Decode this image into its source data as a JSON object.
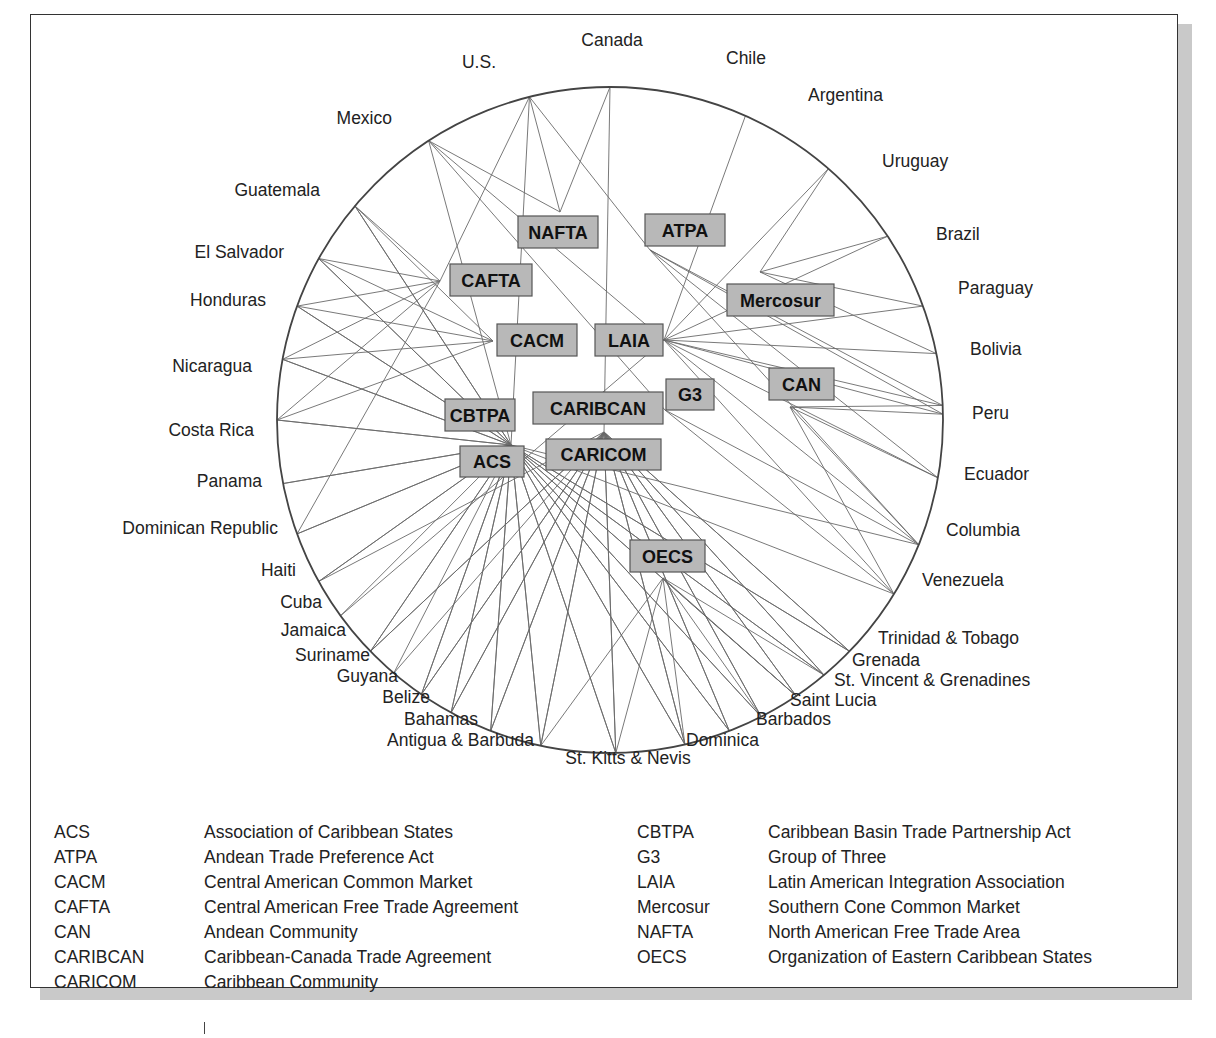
{
  "diagram": {
    "title": "",
    "circle": {
      "cx": 610,
      "cy": 420,
      "r": 333
    },
    "countries": [
      {
        "id": "canada",
        "label": "Canada",
        "angle": -90,
        "lx": 612,
        "ly": 46,
        "anchor": "middle"
      },
      {
        "id": "chile",
        "label": "Chile",
        "angle": -66,
        "lx": 726,
        "ly": 64,
        "anchor": "start"
      },
      {
        "id": "argentina",
        "label": "Argentina",
        "angle": -49,
        "lx": 808,
        "ly": 101,
        "anchor": "start"
      },
      {
        "id": "uruguay",
        "label": "Uruguay",
        "angle": -33.5,
        "lx": 882,
        "ly": 167,
        "anchor": "start"
      },
      {
        "id": "brazil",
        "label": "Brazil",
        "angle": -20,
        "lx": 936,
        "ly": 240,
        "anchor": "start"
      },
      {
        "id": "paraguay",
        "label": "Paraguay",
        "angle": -11.5,
        "lx": 958,
        "ly": 294,
        "anchor": "start"
      },
      {
        "id": "bolivia",
        "label": "Bolivia",
        "angle": -2.5,
        "lx": 970,
        "ly": 355,
        "anchor": "start"
      },
      {
        "id": "peru",
        "label": "Peru",
        "angle": -1,
        "lx": 972,
        "ly": 419,
        "anchor": "start"
      },
      {
        "id": "ecuador",
        "label": "Ecuador",
        "angle": 10,
        "lx": 964,
        "ly": 480,
        "anchor": "start"
      },
      {
        "id": "columbia",
        "label": "Columbia",
        "angle": 22,
        "lx": 946,
        "ly": 536,
        "anchor": "start"
      },
      {
        "id": "venezuela",
        "label": "Venezuela",
        "angle": 31.5,
        "lx": 922,
        "ly": 586,
        "anchor": "start"
      },
      {
        "id": "trinidad",
        "label": "Trinidad & Tobago",
        "angle": 44,
        "lx": 878,
        "ly": 644,
        "anchor": "start"
      },
      {
        "id": "grenada",
        "label": "Grenada",
        "angle": 50,
        "lx": 852,
        "ly": 666,
        "anchor": "start"
      },
      {
        "id": "stvincent",
        "label": "St. Vincent & Grenadines",
        "angle": 56,
        "lx": 834,
        "ly": 686,
        "anchor": "start"
      },
      {
        "id": "saintlucia",
        "label": "Saint Lucia",
        "angle": 63,
        "lx": 790,
        "ly": 706,
        "anchor": "start"
      },
      {
        "id": "barbados",
        "label": "Barbados",
        "angle": 69,
        "lx": 756,
        "ly": 725,
        "anchor": "start"
      },
      {
        "id": "dominica",
        "label": "Dominica",
        "angle": 77,
        "lx": 686,
        "ly": 746,
        "anchor": "start"
      },
      {
        "id": "stkitts",
        "label": "St. Kitts & Nevis",
        "angle": 89,
        "lx": 628,
        "ly": 764,
        "anchor": "middle"
      },
      {
        "id": "antigua",
        "label": "Antigua & Barbuda",
        "angle": 102,
        "lx": 534,
        "ly": 746,
        "anchor": "end"
      },
      {
        "id": "bahamas",
        "label": "Bahamas",
        "angle": 111,
        "lx": 478,
        "ly": 725,
        "anchor": "end"
      },
      {
        "id": "belize",
        "label": "Belize",
        "angle": 118.5,
        "lx": 430,
        "ly": 703,
        "anchor": "end"
      },
      {
        "id": "guyana",
        "label": "Guyana",
        "angle": 124.5,
        "lx": 398,
        "ly": 682,
        "anchor": "end"
      },
      {
        "id": "suriname",
        "label": "Suriname",
        "angle": 130.5,
        "lx": 370,
        "ly": 661,
        "anchor": "end"
      },
      {
        "id": "jamaica",
        "label": "Jamaica",
        "angle": 136,
        "lx": 346,
        "ly": 636,
        "anchor": "end"
      },
      {
        "id": "cuba",
        "label": "Cuba",
        "angle": 144,
        "lx": 322,
        "ly": 608,
        "anchor": "end"
      },
      {
        "id": "haiti",
        "label": "Haiti",
        "angle": 151,
        "lx": 296,
        "ly": 576,
        "anchor": "end"
      },
      {
        "id": "dominican",
        "label": "Dominican Republic",
        "angle": 160,
        "lx": 278,
        "ly": 534,
        "anchor": "end"
      },
      {
        "id": "panama",
        "label": "Panama",
        "angle": 169,
        "lx": 262,
        "ly": 487,
        "anchor": "end"
      },
      {
        "id": "costarica",
        "label": "Costa Rica",
        "angle": 180,
        "lx": 254,
        "ly": 436,
        "anchor": "end"
      },
      {
        "id": "nicaragua",
        "label": "Nicaragua",
        "angle": 190.5,
        "lx": 252,
        "ly": 372,
        "anchor": "end"
      },
      {
        "id": "honduras",
        "label": "Honduras",
        "angle": 200,
        "lx": 266,
        "ly": 306,
        "anchor": "end"
      },
      {
        "id": "elsalvador",
        "label": "El Salvador",
        "angle": 209,
        "lx": 284,
        "ly": 258,
        "anchor": "end"
      },
      {
        "id": "guatemala",
        "label": "Guatemala",
        "angle": 220,
        "lx": 320,
        "ly": 196,
        "anchor": "end"
      },
      {
        "id": "mexico",
        "label": "Mexico",
        "angle": 237,
        "lx": 392,
        "ly": 124,
        "anchor": "end"
      },
      {
        "id": "us",
        "label": "U.S.",
        "angle": 256,
        "lx": 496,
        "ly": 68,
        "anchor": "end"
      }
    ],
    "hubs": [
      {
        "id": "NAFTA",
        "label": "NAFTA",
        "x": 518,
        "y": 216,
        "w": 80,
        "h": 32,
        "px": 560,
        "py": 212
      },
      {
        "id": "ATPA",
        "label": "ATPA",
        "x": 645,
        "y": 214,
        "w": 80,
        "h": 32,
        "px": 650,
        "py": 250
      },
      {
        "id": "CAFTA",
        "label": "CAFTA",
        "x": 450,
        "y": 264,
        "w": 82,
        "h": 32,
        "px": 440,
        "py": 281
      },
      {
        "id": "Mercosur",
        "label": "Mercosur",
        "x": 727,
        "y": 284,
        "w": 107,
        "h": 32,
        "px": 760,
        "py": 272
      },
      {
        "id": "CACM",
        "label": "CACM",
        "x": 497,
        "y": 324,
        "w": 80,
        "h": 32,
        "px": 493,
        "py": 341
      },
      {
        "id": "LAIA",
        "label": "LAIA",
        "x": 595,
        "y": 324,
        "w": 68,
        "h": 32,
        "px": 664,
        "py": 340
      },
      {
        "id": "CAN",
        "label": "CAN",
        "x": 769,
        "y": 368,
        "w": 65,
        "h": 32,
        "px": 790,
        "py": 407
      },
      {
        "id": "G3",
        "label": "G3",
        "x": 666,
        "y": 379,
        "w": 48,
        "h": 31,
        "px": 665,
        "py": 410
      },
      {
        "id": "CARIBCAN",
        "label": "CARIBCAN",
        "x": 533,
        "y": 392,
        "w": 130,
        "h": 32,
        "px": 604,
        "py": 432
      },
      {
        "id": "CBTPA",
        "label": "CBTPA",
        "x": 445,
        "y": 399,
        "w": 70,
        "h": 32,
        "px": 511,
        "py": 445
      },
      {
        "id": "ACS",
        "label": "ACS",
        "x": 460,
        "y": 446,
        "w": 64,
        "h": 31,
        "px": 511,
        "py": 445
      },
      {
        "id": "CARICOM",
        "label": "CARICOM",
        "x": 546,
        "y": 439,
        "w": 115,
        "h": 31,
        "px": 604,
        "py": 432
      },
      {
        "id": "OECS",
        "label": "OECS",
        "x": 630,
        "y": 540,
        "w": 75,
        "h": 32,
        "px": 663,
        "py": 578
      }
    ],
    "memberships": {
      "NAFTA": [
        "us",
        "canada",
        "mexico"
      ],
      "ATPA": [
        "bolivia",
        "columbia",
        "ecuador",
        "peru",
        "us"
      ],
      "CAFTA": [
        "us",
        "guatemala",
        "elsalvador",
        "honduras",
        "nicaragua",
        "costarica",
        "dominican"
      ],
      "Mercosur": [
        "argentina",
        "brazil",
        "paraguay",
        "uruguay"
      ],
      "CACM": [
        "guatemala",
        "elsalvador",
        "honduras",
        "nicaragua",
        "costarica"
      ],
      "LAIA": [
        "argentina",
        "bolivia",
        "brazil",
        "chile",
        "columbia",
        "ecuador",
        "mexico",
        "paraguay",
        "peru",
        "uruguay",
        "venezuela",
        "cuba"
      ],
      "CAN": [
        "bolivia",
        "columbia",
        "ecuador",
        "peru",
        "venezuela"
      ],
      "G3": [
        "mexico",
        "columbia",
        "venezuela"
      ],
      "CARIBCAN": [
        "canada",
        "antigua",
        "bahamas",
        "barbados",
        "belize",
        "dominica",
        "grenada",
        "guyana",
        "jamaica",
        "stkitts",
        "saintlucia",
        "stvincent",
        "trinidad"
      ],
      "CBTPA": [
        "us",
        "antigua",
        "bahamas",
        "barbados",
        "belize",
        "costarica",
        "dominica",
        "dominican",
        "elsalvador",
        "grenada",
        "guatemala",
        "guyana",
        "haiti",
        "honduras",
        "jamaica",
        "nicaragua",
        "panama",
        "saintlucia",
        "stkitts",
        "stvincent",
        "trinidad"
      ],
      "ACS": [
        "antigua",
        "bahamas",
        "barbados",
        "belize",
        "columbia",
        "costarica",
        "cuba",
        "dominica",
        "dominican",
        "elsalvador",
        "grenada",
        "guatemala",
        "guyana",
        "haiti",
        "honduras",
        "jamaica",
        "mexico",
        "nicaragua",
        "panama",
        "stkitts",
        "saintlucia",
        "stvincent",
        "suriname",
        "trinidad",
        "venezuela"
      ],
      "CARICOM": [
        "antigua",
        "bahamas",
        "barbados",
        "belize",
        "dominica",
        "grenada",
        "guyana",
        "haiti",
        "jamaica",
        "stkitts",
        "saintlucia",
        "stvincent",
        "suriname",
        "trinidad"
      ],
      "OECS": [
        "antigua",
        "dominica",
        "grenada",
        "stkitts",
        "saintlucia",
        "stvincent"
      ]
    }
  },
  "legend": {
    "left": [
      {
        "abbr": "ACS",
        "name": "Association of Caribbean States"
      },
      {
        "abbr": "ATPA",
        "name": "Andean Trade Preference Act"
      },
      {
        "abbr": "CACM",
        "name": "Central American Common Market"
      },
      {
        "abbr": "CAFTA",
        "name": "Central American Free Trade Agreement"
      },
      {
        "abbr": "CAN",
        "name": "Andean Community"
      },
      {
        "abbr": "CARIBCAN",
        "name": "Caribbean-Canada Trade Agreement"
      },
      {
        "abbr": "CARICOM",
        "name": "Caribbean Community"
      }
    ],
    "right": [
      {
        "abbr": "CBTPA",
        "name": "Caribbean Basin Trade Partnership Act"
      },
      {
        "abbr": "G3",
        "name": "Group of Three"
      },
      {
        "abbr": "LAIA",
        "name": "Latin American Integration Association"
      },
      {
        "abbr": "Mercosur",
        "name": "Southern Cone Common Market"
      },
      {
        "abbr": "NAFTA",
        "name": "North American Free Trade Area"
      },
      {
        "abbr": "OECS",
        "name": "Organization of Eastern Caribbean States"
      }
    ]
  }
}
